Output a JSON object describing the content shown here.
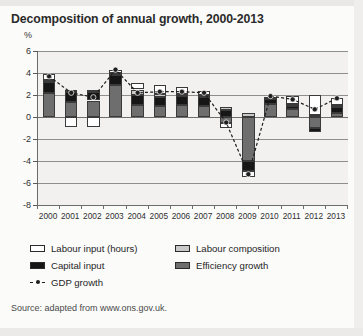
{
  "figure": {
    "title": "Decomposition of annual growth, 2000-2013",
    "unit_label": "%",
    "source": "Source: adapted from www.ons.gov.uk."
  },
  "legend": {
    "items": [
      {
        "label": "Labour input (hours)",
        "key": "labour-hours",
        "color": "#ffffff"
      },
      {
        "label": "Labour composition",
        "key": "labour-comp",
        "color": "#c9c9c9"
      },
      {
        "label": "Capital input",
        "key": "capital",
        "color": "#161616"
      },
      {
        "label": "Efficiency growth",
        "key": "efficiency",
        "color": "#6e6e6e"
      },
      {
        "label": "GDP growth",
        "key": "gdp",
        "color": "#1f1f1f"
      }
    ]
  },
  "chart_data": {
    "type": "bar",
    "stacked": true,
    "title": "Decomposition of annual growth, 2000-2013",
    "xlabel": "",
    "ylabel": "%",
    "ylim": [
      -8,
      6
    ],
    "yticks": [
      6,
      4,
      2,
      0,
      -2,
      -4,
      -6,
      -8
    ],
    "grid": true,
    "legend_position": "below",
    "categories": [
      "2000",
      "2001",
      "2002",
      "2003",
      "2004",
      "2005",
      "2006",
      "2007",
      "2008",
      "2009",
      "2010",
      "2011",
      "2012",
      "2013"
    ],
    "series": [
      {
        "name": "Efficiency growth",
        "color": "#6e6e6e",
        "values": [
          2.2,
          1.4,
          1.5,
          2.9,
          1.1,
          1.0,
          1.1,
          1.0,
          -0.5,
          -4.0,
          1.2,
          0.7,
          -1.0,
          0.4
        ]
      },
      {
        "name": "Capital input",
        "color": "#161616",
        "values": [
          1.0,
          0.9,
          0.8,
          0.9,
          0.9,
          0.8,
          0.8,
          0.8,
          0.6,
          -0.9,
          0.4,
          0.3,
          -0.4,
          0.5
        ]
      },
      {
        "name": "Labour composition",
        "color": "#c9c9c9",
        "values": [
          0.2,
          0.2,
          0.2,
          0.2,
          0.5,
          0.3,
          0.2,
          0.2,
          0.3,
          0.4,
          0.2,
          0.2,
          0.2,
          0.2
        ]
      },
      {
        "name": "Labour input (hours)",
        "color": "#ffffff",
        "values": [
          0.5,
          -0.9,
          -0.9,
          0.3,
          0.6,
          0.8,
          0.6,
          0.4,
          -0.5,
          -0.6,
          0.0,
          0.7,
          1.8,
          0.6
        ]
      }
    ],
    "line_series": {
      "name": "GDP growth",
      "color": "#1f1f1f",
      "style": "dashed-with-markers",
      "values": [
        3.7,
        2.2,
        1.8,
        4.3,
        2.2,
        2.3,
        2.3,
        2.2,
        -0.5,
        -5.2,
        1.9,
        1.6,
        0.7,
        1.7
      ]
    }
  }
}
